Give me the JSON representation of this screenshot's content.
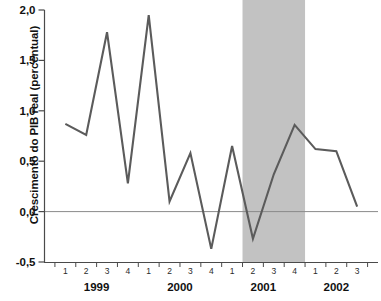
{
  "chart_data": {
    "type": "line",
    "title": "",
    "xlabel": "",
    "ylabel": "Crescimento do PIB real (percentual)",
    "ylim": [
      -0.5,
      2.0
    ],
    "ytick_labels": [
      "2,0",
      "1,5",
      "1,0",
      "0,5",
      "0,0",
      "-0,5"
    ],
    "ytick_values": [
      2.0,
      1.5,
      1.0,
      0.5,
      0.0,
      -0.5
    ],
    "grid": false,
    "legend": "none",
    "zero_line": true,
    "x": [
      "1999 Q1",
      "1999 Q2",
      "1999 Q3",
      "1999 Q4",
      "2000 Q1",
      "2000 Q2",
      "2000 Q3",
      "2000 Q4",
      "2001 Q1",
      "2001 Q2",
      "2001 Q3",
      "2001 Q4",
      "2002 Q1",
      "2002 Q2",
      "2002 Q3"
    ],
    "quarter_labels": [
      "1",
      "2",
      "3",
      "4",
      "1",
      "2",
      "3",
      "4",
      "1",
      "2",
      "3",
      "4",
      "1",
      "2",
      "3"
    ],
    "year_labels": [
      "1999",
      "2000",
      "2001",
      "2002"
    ],
    "values": [
      0.87,
      0.76,
      1.78,
      0.28,
      1.95,
      0.1,
      0.58,
      -0.37,
      0.65,
      -0.27,
      0.37,
      0.86,
      0.62,
      0.6,
      0.05
    ],
    "series_color": "#5b5b5b",
    "shaded_band": {
      "label": "Recessao",
      "start": "2001 Q2",
      "end": "2001 Q4",
      "color": "#c2c2c2"
    }
  }
}
